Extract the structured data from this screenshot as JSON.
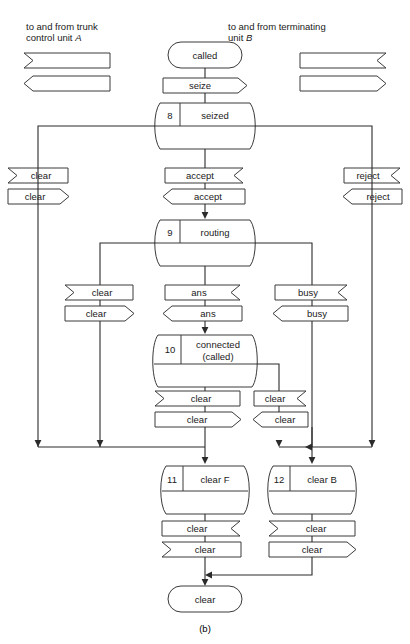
{
  "figure": {
    "caption": "(b)",
    "notes": {
      "left_line1": "to and from trunk",
      "left_line2_pre": "control unit ",
      "left_line2_em": "A",
      "right_line1": "to and from terminating",
      "right_line2_pre": "unit ",
      "right_line2_em": "B"
    },
    "colors": {
      "stroke": "#3a3a3a",
      "line": "#2b2b2b",
      "text": "#1a1a1a",
      "background": "#ffffff"
    }
  },
  "terminals": {
    "start": "called",
    "end": "clear"
  },
  "states": [
    {
      "number": "8",
      "name": "seized"
    },
    {
      "number": "9",
      "name": "routing"
    },
    {
      "number": "10",
      "name_line1": "connected",
      "name_line2": "(called)"
    },
    {
      "number": "11",
      "name": "clear F"
    },
    {
      "number": "12",
      "name": "clear B"
    }
  ],
  "signals": {
    "seize": "seize",
    "accept_out": "accept",
    "accept_in": "accept",
    "clear_a_in": "clear",
    "clear_a_out": "clear",
    "reject_out": "reject",
    "reject_in": "reject",
    "clear_route_out": "clear",
    "clear_route_in": "clear",
    "ans_out": "ans",
    "ans_in": "ans",
    "busy_out": "busy",
    "busy_in": "busy",
    "clear_conn_left_out": "clear",
    "clear_conn_left_in": "clear",
    "clear_conn_right_out": "clear",
    "clear_conn_right_in": "clear",
    "clear_f_out": "clear",
    "clear_f_in": "clear",
    "clear_b_out": "clear",
    "clear_b_in": "clear"
  },
  "legend": {
    "left_incoming": "",
    "left_outgoing": "",
    "right_incoming": "",
    "right_outgoing": ""
  }
}
